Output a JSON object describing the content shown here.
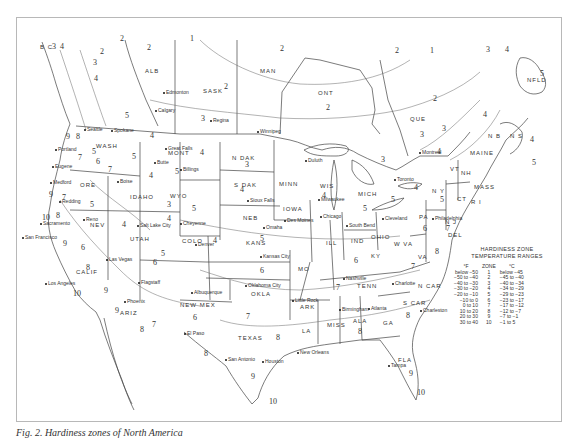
{
  "caption": "Fig. 2. Hardiness zones of North America",
  "legend": {
    "title_line1": "HARDINESS ZONE",
    "title_line2": "TEMPERATURE RANGES",
    "headers": {
      "f": "°F",
      "zone": "ZONE",
      "c": "°C"
    },
    "rows": [
      {
        "f": "below −50",
        "zone": "1",
        "c": "below −45"
      },
      {
        "f": "−50 to −40",
        "zone": "2",
        "c": "−45 to −40"
      },
      {
        "f": "−40 to −30",
        "zone": "3",
        "c": "−40 to −34"
      },
      {
        "f": "−30 to −20",
        "zone": "4",
        "c": "−34 to −29"
      },
      {
        "f": "−20 to −10",
        "zone": "5",
        "c": "−29 to −23"
      },
      {
        "f": "−10 to 0",
        "zone": "6",
        "c": "−23 to −17"
      },
      {
        "f": "0 to 10",
        "zone": "7",
        "c": "−17 to −12"
      },
      {
        "f": "10 to 20",
        "zone": "8",
        "c": "−12 to −7"
      },
      {
        "f": "20 to 30",
        "zone": "9",
        "c": "−7 to −1"
      },
      {
        "f": "30 to 40",
        "zone": "10",
        "c": "−1 to 5"
      }
    ]
  },
  "regions": [
    {
      "id": "bc",
      "label": "B C",
      "x": 40,
      "y": 44
    },
    {
      "id": "alb",
      "label": "ALB",
      "x": 145,
      "y": 68
    },
    {
      "id": "sask",
      "label": "SASK",
      "x": 203,
      "y": 88
    },
    {
      "id": "man",
      "label": "MAN",
      "x": 260,
      "y": 68
    },
    {
      "id": "ont",
      "label": "ONT",
      "x": 318,
      "y": 90
    },
    {
      "id": "que",
      "label": "QUE",
      "x": 410,
      "y": 116
    },
    {
      "id": "nfld",
      "label": "NFLD",
      "x": 527,
      "y": 77
    },
    {
      "id": "nb",
      "label": "N B",
      "x": 488,
      "y": 133
    },
    {
      "id": "ns",
      "label": "N S",
      "x": 510,
      "y": 133
    },
    {
      "id": "maine",
      "label": "MAINE",
      "x": 470,
      "y": 150
    },
    {
      "id": "wash",
      "label": "WASH",
      "x": 96,
      "y": 143
    },
    {
      "id": "ore",
      "label": "ORE",
      "x": 80,
      "y": 182
    },
    {
      "id": "idaho",
      "label": "IDAHO",
      "x": 130,
      "y": 194
    },
    {
      "id": "mont",
      "label": "MONT",
      "x": 168,
      "y": 150
    },
    {
      "id": "wyo",
      "label": "WYO",
      "x": 170,
      "y": 193
    },
    {
      "id": "nev",
      "label": "NEV",
      "x": 90,
      "y": 222
    },
    {
      "id": "calif",
      "label": "CALIF",
      "x": 76,
      "y": 269
    },
    {
      "id": "utah",
      "label": "UTAH",
      "x": 130,
      "y": 236
    },
    {
      "id": "colo",
      "label": "COLO",
      "x": 182,
      "y": 238
    },
    {
      "id": "ariz",
      "label": "ARIZ",
      "x": 120,
      "y": 310
    },
    {
      "id": "newmex",
      "label": "NEW MEX",
      "x": 180,
      "y": 302
    },
    {
      "id": "ndak",
      "label": "N DAK",
      "x": 232,
      "y": 155
    },
    {
      "id": "sdak",
      "label": "S DAK",
      "x": 234,
      "y": 182
    },
    {
      "id": "neb",
      "label": "NEB",
      "x": 243,
      "y": 215
    },
    {
      "id": "kans",
      "label": "KANS",
      "x": 246,
      "y": 240
    },
    {
      "id": "okla",
      "label": "OKLA",
      "x": 251,
      "y": 291
    },
    {
      "id": "texas",
      "label": "TEXAS",
      "x": 238,
      "y": 335
    },
    {
      "id": "minn",
      "label": "MINN",
      "x": 279,
      "y": 181
    },
    {
      "id": "iowa",
      "label": "IOWA",
      "x": 283,
      "y": 206
    },
    {
      "id": "mo",
      "label": "MO",
      "x": 298,
      "y": 266
    },
    {
      "id": "ark",
      "label": "ARK",
      "x": 300,
      "y": 304
    },
    {
      "id": "la",
      "label": "LA",
      "x": 302,
      "y": 328
    },
    {
      "id": "wis",
      "label": "WIS",
      "x": 320,
      "y": 183
    },
    {
      "id": "ill",
      "label": "ILL",
      "x": 326,
      "y": 240
    },
    {
      "id": "mich",
      "label": "MICH",
      "x": 358,
      "y": 191
    },
    {
      "id": "ind",
      "label": "IND",
      "x": 351,
      "y": 238
    },
    {
      "id": "ohio",
      "label": "OHIO",
      "x": 371,
      "y": 234
    },
    {
      "id": "ky",
      "label": "KY",
      "x": 371,
      "y": 253
    },
    {
      "id": "tenn",
      "label": "TENN",
      "x": 357,
      "y": 283
    },
    {
      "id": "miss",
      "label": "MISS",
      "x": 327,
      "y": 322
    },
    {
      "id": "ala",
      "label": "ALA",
      "x": 353,
      "y": 318
    },
    {
      "id": "ga",
      "label": "GA",
      "x": 383,
      "y": 320
    },
    {
      "id": "fla",
      "label": "FLA",
      "x": 398,
      "y": 357
    },
    {
      "id": "scar",
      "label": "S CAR",
      "x": 403,
      "y": 300
    },
    {
      "id": "ncar",
      "label": "N CAR",
      "x": 418,
      "y": 283
    },
    {
      "id": "va",
      "label": "VA",
      "x": 418,
      "y": 254
    },
    {
      "id": "wva",
      "label": "W VA",
      "x": 394,
      "y": 241
    },
    {
      "id": "pa",
      "label": "PA",
      "x": 419,
      "y": 214
    },
    {
      "id": "ny",
      "label": "N Y",
      "x": 432,
      "y": 188
    },
    {
      "id": "nj",
      "label": "N J",
      "x": 445,
      "y": 219
    },
    {
      "id": "del",
      "label": "DEL",
      "x": 448,
      "y": 232
    },
    {
      "id": "mass",
      "label": "MASS",
      "x": 474,
      "y": 184
    },
    {
      "id": "ri",
      "label": "R I",
      "x": 471,
      "y": 199
    },
    {
      "id": "ct",
      "label": "CT",
      "x": 457,
      "y": 196
    },
    {
      "id": "vt",
      "label": "VT",
      "x": 450,
      "y": 166
    },
    {
      "id": "nh",
      "label": "NH",
      "x": 461,
      "y": 170
    }
  ],
  "cities": [
    {
      "name": "Edmonton",
      "x": 163,
      "y": 89
    },
    {
      "name": "Calgary",
      "x": 155,
      "y": 107
    },
    {
      "name": "Regina",
      "x": 210,
      "y": 117
    },
    {
      "name": "Winnipeg",
      "x": 257,
      "y": 128
    },
    {
      "name": "Seattle",
      "x": 84,
      "y": 126
    },
    {
      "name": "Spokane",
      "x": 111,
      "y": 127
    },
    {
      "name": "Portland",
      "x": 55,
      "y": 146
    },
    {
      "name": "Eugene",
      "x": 52,
      "y": 163
    },
    {
      "name": "Medford",
      "x": 50,
      "y": 179
    },
    {
      "name": "Redding",
      "x": 59,
      "y": 198
    },
    {
      "name": "Sacramento",
      "x": 40,
      "y": 220
    },
    {
      "name": "San Francisco",
      "x": 22,
      "y": 234
    },
    {
      "name": "Reno",
      "x": 83,
      "y": 216
    },
    {
      "name": "Boise",
      "x": 117,
      "y": 178
    },
    {
      "name": "Great Falls",
      "x": 165,
      "y": 145
    },
    {
      "name": "Butte",
      "x": 154,
      "y": 159
    },
    {
      "name": "Billings",
      "x": 180,
      "y": 166
    },
    {
      "name": "Salt Lake City",
      "x": 137,
      "y": 222
    },
    {
      "name": "Cheyenne",
      "x": 180,
      "y": 220
    },
    {
      "name": "Denver",
      "x": 195,
      "y": 241
    },
    {
      "name": "Las Vegas",
      "x": 106,
      "y": 256
    },
    {
      "name": "Los Angeles",
      "x": 45,
      "y": 280
    },
    {
      "name": "Flagstaff",
      "x": 138,
      "y": 279
    },
    {
      "name": "Phoenix",
      "x": 124,
      "y": 298
    },
    {
      "name": "Albuquerque",
      "x": 191,
      "y": 289
    },
    {
      "name": "El Paso",
      "x": 184,
      "y": 330
    },
    {
      "name": "Duluth",
      "x": 305,
      "y": 157
    },
    {
      "name": "Sioux Falls",
      "x": 247,
      "y": 197
    },
    {
      "name": "Milwaukee",
      "x": 318,
      "y": 196
    },
    {
      "name": "Omaha",
      "x": 263,
      "y": 224
    },
    {
      "name": "Des Moines",
      "x": 284,
      "y": 217
    },
    {
      "name": "Chicago",
      "x": 320,
      "y": 213
    },
    {
      "name": "South Bend",
      "x": 346,
      "y": 222
    },
    {
      "name": "Kansas City",
      "x": 260,
      "y": 253
    },
    {
      "name": "Oklahoma City",
      "x": 245,
      "y": 282
    },
    {
      "name": "Little Rock",
      "x": 292,
      "y": 297
    },
    {
      "name": "Nashville",
      "x": 343,
      "y": 275
    },
    {
      "name": "Birmingham",
      "x": 339,
      "y": 306
    },
    {
      "name": "Atlanta",
      "x": 368,
      "y": 305
    },
    {
      "name": "New Orleans",
      "x": 297,
      "y": 349
    },
    {
      "name": "Houston",
      "x": 262,
      "y": 358
    },
    {
      "name": "San Antonio",
      "x": 225,
      "y": 356
    },
    {
      "name": "Charlotte",
      "x": 392,
      "y": 280
    },
    {
      "name": "Charleston",
      "x": 420,
      "y": 307
    },
    {
      "name": "Tampa",
      "x": 388,
      "y": 362
    },
    {
      "name": "Montreal",
      "x": 419,
      "y": 149
    },
    {
      "name": "Toronto",
      "x": 394,
      "y": 176
    },
    {
      "name": "Cleveland",
      "x": 382,
      "y": 215
    },
    {
      "name": "Philadelphia",
      "x": 432,
      "y": 215
    }
  ],
  "zones": [
    {
      "z": "2",
      "x": 120,
      "y": 34
    },
    {
      "z": "1",
      "x": 190,
      "y": 34
    },
    {
      "z": "2",
      "x": 147,
      "y": 43
    },
    {
      "z": "2",
      "x": 280,
      "y": 44
    },
    {
      "z": "2",
      "x": 395,
      "y": 46
    },
    {
      "z": "1",
      "x": 430,
      "y": 46
    },
    {
      "z": "3",
      "x": 486,
      "y": 45
    },
    {
      "z": "4",
      "x": 505,
      "y": 45
    },
    {
      "z": "3",
      "x": 52,
      "y": 42
    },
    {
      "z": "4",
      "x": 60,
      "y": 42
    },
    {
      "z": "2",
      "x": 100,
      "y": 47
    },
    {
      "z": "3",
      "x": 93,
      "y": 58
    },
    {
      "z": "4",
      "x": 94,
      "y": 74
    },
    {
      "z": "2",
      "x": 224,
      "y": 82
    },
    {
      "z": "2",
      "x": 326,
      "y": 103
    },
    {
      "z": "3",
      "x": 201,
      "y": 114
    },
    {
      "z": "2",
      "x": 433,
      "y": 94
    },
    {
      "z": "5",
      "x": 540,
      "y": 69
    },
    {
      "z": "3",
      "x": 442,
      "y": 124
    },
    {
      "z": "4",
      "x": 483,
      "y": 110
    },
    {
      "z": "4",
      "x": 530,
      "y": 135
    },
    {
      "z": "5",
      "x": 532,
      "y": 158
    },
    {
      "z": "3",
      "x": 381,
      "y": 155
    },
    {
      "z": "4",
      "x": 437,
      "y": 147
    },
    {
      "z": "3",
      "x": 420,
      "y": 130
    },
    {
      "z": "5",
      "x": 125,
      "y": 111
    },
    {
      "z": "4",
      "x": 150,
      "y": 131
    },
    {
      "z": "5",
      "x": 92,
      "y": 147
    },
    {
      "z": "8",
      "x": 76,
      "y": 132
    },
    {
      "z": "9",
      "x": 66,
      "y": 132
    },
    {
      "z": "7",
      "x": 78,
      "y": 153
    },
    {
      "z": "6",
      "x": 96,
      "y": 157
    },
    {
      "z": "7",
      "x": 108,
      "y": 165
    },
    {
      "z": "5",
      "x": 132,
      "y": 152
    },
    {
      "z": "4",
      "x": 149,
      "y": 171
    },
    {
      "z": "5",
      "x": 175,
      "y": 167
    },
    {
      "z": "4",
      "x": 200,
      "y": 148
    },
    {
      "z": "3",
      "x": 245,
      "y": 160
    },
    {
      "z": "4",
      "x": 240,
      "y": 185
    },
    {
      "z": "4",
      "x": 322,
      "y": 191
    },
    {
      "z": "5",
      "x": 363,
      "y": 204
    },
    {
      "z": "5",
      "x": 391,
      "y": 195
    },
    {
      "z": "4",
      "x": 414,
      "y": 183
    },
    {
      "z": "5",
      "x": 440,
      "y": 195
    },
    {
      "z": "9",
      "x": 49,
      "y": 190
    },
    {
      "z": "7",
      "x": 62,
      "y": 193
    },
    {
      "z": "5",
      "x": 90,
      "y": 200
    },
    {
      "z": "8",
      "x": 56,
      "y": 211
    },
    {
      "z": "10",
      "x": 42,
      "y": 213
    },
    {
      "z": "4",
      "x": 122,
      "y": 220
    },
    {
      "z": "3",
      "x": 167,
      "y": 200
    },
    {
      "z": "5",
      "x": 192,
      "y": 204
    },
    {
      "z": "4",
      "x": 167,
      "y": 214
    },
    {
      "z": "9",
      "x": 63,
      "y": 239
    },
    {
      "z": "6",
      "x": 81,
      "y": 243
    },
    {
      "z": "5",
      "x": 161,
      "y": 249
    },
    {
      "z": "6",
      "x": 153,
      "y": 258
    },
    {
      "z": "4",
      "x": 213,
      "y": 236
    },
    {
      "z": "5",
      "x": 260,
      "y": 234
    },
    {
      "z": "6",
      "x": 260,
      "y": 266
    },
    {
      "z": "8",
      "x": 86,
      "y": 263
    },
    {
      "z": "9",
      "x": 104,
      "y": 286
    },
    {
      "z": "10",
      "x": 73,
      "y": 289
    },
    {
      "z": "9",
      "x": 115,
      "y": 306
    },
    {
      "z": "8",
      "x": 140,
      "y": 325
    },
    {
      "z": "7",
      "x": 152,
      "y": 320
    },
    {
      "z": "6",
      "x": 193,
      "y": 313
    },
    {
      "z": "7",
      "x": 246,
      "y": 312
    },
    {
      "z": "8",
      "x": 276,
      "y": 333
    },
    {
      "z": "8",
      "x": 204,
      "y": 349
    },
    {
      "z": "9",
      "x": 251,
      "y": 372
    },
    {
      "z": "10",
      "x": 269,
      "y": 397
    },
    {
      "z": "7",
      "x": 336,
      "y": 283
    },
    {
      "z": "8",
      "x": 358,
      "y": 327
    },
    {
      "z": "8",
      "x": 406,
      "y": 311
    },
    {
      "z": "9",
      "x": 409,
      "y": 369
    },
    {
      "z": "10",
      "x": 417,
      "y": 388
    },
    {
      "z": "6",
      "x": 354,
      "y": 256
    },
    {
      "z": "7",
      "x": 411,
      "y": 262
    },
    {
      "z": "8",
      "x": 435,
      "y": 247
    },
    {
      "z": "6",
      "x": 423,
      "y": 224
    },
    {
      "z": "7",
      "x": 446,
      "y": 224
    }
  ],
  "colors": {
    "ink": "#333333",
    "frame": "#b8b8b8",
    "paper": "#ffffff"
  }
}
